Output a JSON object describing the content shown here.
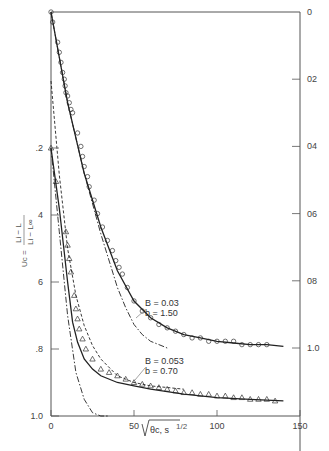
{
  "chart_data": {
    "type": "line",
    "title": "",
    "xlabel": "√θc, s^1/2",
    "ylabel_left": "Uc = (Li − L)/(Li − L∞)",
    "ylabel_right": "",
    "x_ticks": [
      "0",
      "50",
      "100",
      "150"
    ],
    "xlim": [
      0,
      150
    ],
    "left_axis": {
      "ticks": [
        ".2",
        "4",
        "6",
        ".8",
        "1.0"
      ],
      "values": [
        0.2,
        0.4,
        0.6,
        0.8,
        1.0
      ],
      "ylim": [
        0,
        1.0
      ],
      "inverted": true
    },
    "right_axis": {
      "ticks": [
        "0",
        "02",
        "04",
        "06",
        "08",
        "1.0"
      ],
      "values": [
        0,
        0.2,
        0.4,
        0.6,
        0.8,
        1.0
      ],
      "ylim": [
        0,
        1.0
      ],
      "inverted": true
    },
    "annotations": [
      {
        "text": [
          "B = 0.03",
          "b = 1.50"
        ],
        "series": "upper (circles, right axis)"
      },
      {
        "text": [
          "B = 0.053",
          "b = 0.70"
        ],
        "series": "lower (triangles, left axis)"
      }
    ],
    "series": [
      {
        "name": "Experimental, B = 0.03, b = 1.50 (circles)",
        "axis": "right",
        "marker": "circle",
        "x": [
          0,
          1,
          4,
          5,
          6,
          7,
          8,
          8.5,
          9,
          10,
          11,
          12,
          13,
          16,
          18,
          19,
          20,
          22,
          23,
          26,
          28,
          31,
          34,
          37,
          39,
          41,
          43,
          46,
          50,
          55,
          60,
          65,
          70,
          75,
          80,
          85,
          90,
          95,
          100,
          105,
          110,
          115,
          120,
          125,
          130
        ],
        "y": [
          0.0,
          0.03,
          0.09,
          0.12,
          0.15,
          0.18,
          0.2,
          0.22,
          0.24,
          0.25,
          0.27,
          0.29,
          0.3,
          0.36,
          0.4,
          0.43,
          0.46,
          0.49,
          0.52,
          0.56,
          0.6,
          0.64,
          0.68,
          0.71,
          0.74,
          0.76,
          0.78,
          0.82,
          0.86,
          0.89,
          0.91,
          0.93,
          0.94,
          0.95,
          0.96,
          0.97,
          0.97,
          0.98,
          0.98,
          0.98,
          0.98,
          0.99,
          0.99,
          0.99,
          0.99
        ]
      },
      {
        "name": "Model fit, B = 0.03 (solid)",
        "axis": "right",
        "style": "solid",
        "x": [
          0,
          10,
          20,
          30,
          40,
          50,
          60,
          70,
          80,
          90,
          100,
          110,
          120,
          130,
          140
        ],
        "y": [
          0.0,
          0.27,
          0.48,
          0.64,
          0.77,
          0.86,
          0.91,
          0.94,
          0.96,
          0.97,
          0.98,
          0.985,
          0.99,
          0.99,
          0.995
        ]
      },
      {
        "name": "Model, B = 0.03 (dash-dot)",
        "axis": "right",
        "style": "dashdot",
        "x": [
          0,
          10,
          20,
          30,
          40,
          45,
          50,
          55,
          60,
          65,
          70
        ],
        "y": [
          0.0,
          0.27,
          0.48,
          0.66,
          0.82,
          0.88,
          0.93,
          0.96,
          0.98,
          0.99,
          1.0
        ]
      },
      {
        "name": "Experimental, B = 0.053, b = 0.70 (triangles)",
        "axis": "left",
        "marker": "triangle",
        "x": [
          0,
          3,
          9,
          10,
          11,
          12,
          14,
          15,
          16,
          17,
          19,
          21,
          25,
          30,
          35,
          40,
          45,
          50,
          55,
          60,
          65,
          70,
          75,
          80,
          85,
          90,
          95,
          100,
          105,
          110,
          115,
          120,
          125,
          130,
          135
        ],
        "y": [
          0.2,
          0.3,
          0.45,
          0.49,
          0.53,
          0.57,
          0.64,
          0.68,
          0.71,
          0.74,
          0.77,
          0.8,
          0.83,
          0.86,
          0.87,
          0.88,
          0.89,
          0.9,
          0.905,
          0.91,
          0.915,
          0.92,
          0.925,
          0.93,
          0.93,
          0.935,
          0.935,
          0.94,
          0.94,
          0.945,
          0.945,
          0.95,
          0.95,
          0.95,
          0.955
        ]
      },
      {
        "name": "Model fit, B = 0.053 (solid)",
        "axis": "left",
        "style": "solid",
        "x": [
          0,
          5,
          10,
          13,
          16,
          20,
          25,
          30,
          40,
          50,
          60,
          80,
          100,
          120,
          140
        ],
        "y": [
          0.2,
          0.38,
          0.6,
          0.72,
          0.78,
          0.83,
          0.86,
          0.88,
          0.9,
          0.91,
          0.92,
          0.935,
          0.945,
          0.95,
          0.955
        ]
      },
      {
        "name": "Model, B = 0.053 (dashed)",
        "axis": "left",
        "style": "dashed",
        "x": [
          0,
          5,
          10,
          15,
          20,
          25,
          30,
          40,
          50,
          60,
          70,
          80
        ],
        "y": [
          0.0,
          0.28,
          0.5,
          0.64,
          0.73,
          0.79,
          0.83,
          0.88,
          0.9,
          0.91,
          0.915,
          0.92
        ]
      },
      {
        "name": "Model, B = 0.053 (dash-dot)",
        "axis": "left",
        "style": "dashdot",
        "x": [
          0,
          5,
          10,
          15,
          20,
          25,
          30,
          35
        ],
        "y": [
          0.2,
          0.45,
          0.7,
          0.87,
          0.95,
          0.99,
          1.0,
          1.0
        ]
      }
    ],
    "grid": false,
    "legend": "none (inline annotations)"
  }
}
